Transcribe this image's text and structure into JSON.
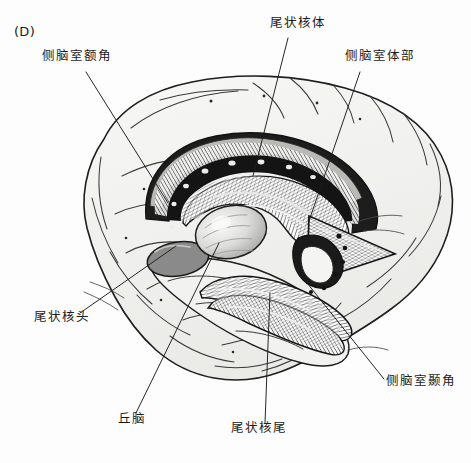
{
  "figure": {
    "panel_letter": "(D)",
    "background_color": "#fdfdfd",
    "ink_color": "#1b1b1b",
    "width": 471,
    "height": 463
  },
  "labels": [
    {
      "id": "frontal-horn",
      "text": "侧脑室额角",
      "x": 42,
      "y": 57,
      "leader": {
        "x1": 86,
        "y1": 72,
        "x2": 168,
        "y2": 203
      }
    },
    {
      "id": "caudate-body",
      "text": "尾状核体",
      "x": 270,
      "y": 24,
      "leader": {
        "x1": 288,
        "y1": 38,
        "x2": 253,
        "y2": 176
      }
    },
    {
      "id": "ventricle-body",
      "text": "侧脑室体部",
      "x": 345,
      "y": 57,
      "leader": {
        "x1": 360,
        "y1": 72,
        "x2": 308,
        "y2": 224
      }
    },
    {
      "id": "caudate-head",
      "text": "尾状核头",
      "x": 34,
      "y": 318,
      "leader": {
        "x1": 80,
        "y1": 313,
        "x2": 176,
        "y2": 246
      }
    },
    {
      "id": "thalamus",
      "text": "丘脑",
      "x": 118,
      "y": 420,
      "leader": {
        "x1": 136,
        "y1": 413,
        "x2": 219,
        "y2": 243
      }
    },
    {
      "id": "caudate-tail",
      "text": "尾状核尾",
      "x": 231,
      "y": 429,
      "leader": {
        "x1": 265,
        "y1": 423,
        "x2": 270,
        "y2": 293
      }
    },
    {
      "id": "temporal-horn",
      "text": "侧脑室颞角",
      "x": 386,
      "y": 382,
      "leader": {
        "x1": 384,
        "y1": 379,
        "x2": 295,
        "y2": 268
      }
    }
  ],
  "structures": {
    "cerebrum_outline": "cerebral-hemisphere-lateral-view",
    "caudate_nucleus": "c-shaped-caudate-nucleus",
    "thalamus": "thalamus-oval",
    "lateral_ventricle": "lateral-ventricle-cast",
    "shading_color_dark": "#1d1d1d",
    "shading_color_mid": "#8a8a8a",
    "shading_color_light": "#d8d8d6",
    "cortex_fill": "#f0f0ee"
  }
}
